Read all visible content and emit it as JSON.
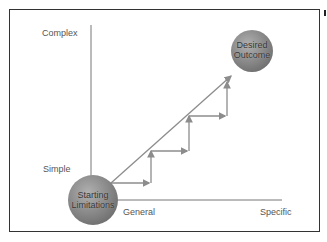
{
  "diagram": {
    "y_axis": {
      "top_label": "Complex",
      "bottom_label": "Simple"
    },
    "x_axis": {
      "left_label": "General",
      "right_label": "Specific"
    },
    "start_node": {
      "line1": "Starting",
      "line2": "Limitations"
    },
    "end_node": {
      "line1": "Desired",
      "line2": "Outcome"
    },
    "steps_count": 3,
    "colors": {
      "node_fill": "#8a8a8a",
      "arrow": "#8c8c8c",
      "axis": "#777777",
      "frame": "#333333"
    }
  }
}
